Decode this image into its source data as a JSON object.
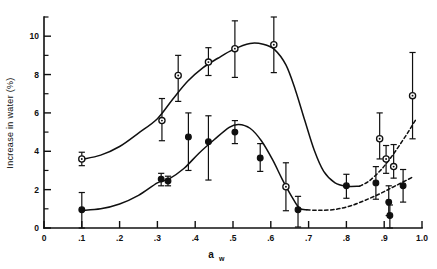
{
  "chart_data": {
    "type": "scatter",
    "title": "",
    "xlabel": "a_w",
    "xlabel_base": "a",
    "xlabel_sub": "w",
    "ylabel": "Increase in water (%)",
    "xlim": [
      0,
      1.0
    ],
    "ylim": [
      0,
      11
    ],
    "grid": false,
    "legend_position": "none",
    "x_ticks": [
      "0",
      ".1",
      ".2",
      ".3",
      ".4",
      ".5",
      ".6",
      ".7",
      ".8",
      ".9",
      "1.0"
    ],
    "x_tick_values": [
      0,
      0.1,
      0.2,
      0.3,
      0.4,
      0.5,
      0.6,
      0.7,
      0.8,
      0.9,
      1.0
    ],
    "y_ticks": [
      "0",
      "2",
      "4",
      "6",
      "8",
      "10"
    ],
    "y_tick_values": [
      0,
      2,
      4,
      6,
      8,
      10
    ],
    "y_minor_values": [
      1,
      3,
      5,
      7,
      9,
      11
    ],
    "series": [
      {
        "name": "open-circle-series",
        "marker": "open-circle",
        "line_style": "solid-then-dashed",
        "points": [
          {
            "x": 0.1,
            "y": 3.6,
            "err_low": 0.35,
            "err_high": 0.35
          },
          {
            "x": 0.312,
            "y": 5.6,
            "err_low": 1.05,
            "err_high": 1.15
          },
          {
            "x": 0.355,
            "y": 7.95,
            "err_low": 1.35,
            "err_high": 1.05
          },
          {
            "x": 0.435,
            "y": 8.65,
            "err_low": 0.7,
            "err_high": 0.75
          },
          {
            "x": 0.505,
            "y": 9.35,
            "err_low": 1.5,
            "err_high": 1.45
          },
          {
            "x": 0.608,
            "y": 9.55,
            "err_low": 1.45,
            "err_high": 1.55
          },
          {
            "x": 0.64,
            "y": 2.15,
            "err_low": 1.25,
            "err_high": 1.25
          },
          {
            "x": 0.888,
            "y": 4.65,
            "err_low": 1.05,
            "err_high": 1.35
          },
          {
            "x": 0.905,
            "y": 3.6,
            "err_low": 0.75,
            "err_high": 0.7
          },
          {
            "x": 0.925,
            "y": 3.2,
            "err_low": 0.6,
            "err_high": 1.15
          },
          {
            "x": 0.975,
            "y": 6.9,
            "err_low": 2.25,
            "err_high": 2.25
          }
        ]
      },
      {
        "name": "filled-circle-series",
        "marker": "filled-circle",
        "line_style": "solid-then-dashed",
        "points": [
          {
            "x": 0.1,
            "y": 0.95,
            "err_low": 0.95,
            "err_high": 0.9
          },
          {
            "x": 0.31,
            "y": 2.55,
            "err_low": 0.35,
            "err_high": 0.3
          },
          {
            "x": 0.328,
            "y": 2.45,
            "err_low": 0.25,
            "err_high": 0.25
          },
          {
            "x": 0.382,
            "y": 4.75,
            "err_low": 1.75,
            "err_high": 1.25
          },
          {
            "x": 0.435,
            "y": 4.5,
            "err_low": 2.0,
            "err_high": 1.35
          },
          {
            "x": 0.505,
            "y": 5.0,
            "err_low": 0.6,
            "err_high": 0.6
          },
          {
            "x": 0.572,
            "y": 3.65,
            "err_low": 0.7,
            "err_high": 0.75
          },
          {
            "x": 0.672,
            "y": 0.95,
            "err_low": 0.9,
            "err_high": 0.7
          },
          {
            "x": 0.8,
            "y": 2.2,
            "err_low": 0.65,
            "err_high": 0.6
          },
          {
            "x": 0.878,
            "y": 2.35,
            "err_low": 0.85,
            "err_high": 0.85
          },
          {
            "x": 0.912,
            "y": 1.35,
            "err_low": 0.7,
            "err_high": 0.85
          },
          {
            "x": 0.915,
            "y": 0.65,
            "err_low": 0.65,
            "err_high": 0.55
          },
          {
            "x": 0.95,
            "y": 2.2,
            "err_low": 0.85,
            "err_high": 0.85
          }
        ]
      }
    ],
    "colors": {
      "ink": "#101010",
      "background": "#ffffff"
    }
  }
}
